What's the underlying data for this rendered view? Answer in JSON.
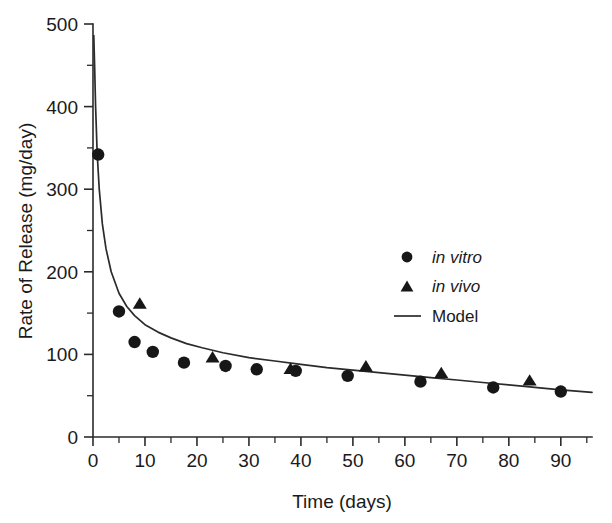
{
  "chart_data": {
    "type": "scatter",
    "title": "",
    "xlabel": "Time (days)",
    "ylabel": "Rate of Release (mg/day)",
    "xlim": [
      0,
      96
    ],
    "ylim": [
      0,
      500
    ],
    "grid": false,
    "legend_position": "center-right",
    "x_ticks": [
      0,
      10,
      20,
      30,
      40,
      50,
      60,
      70,
      80,
      90
    ],
    "x_tick_labels": [
      "0",
      "10",
      "20",
      "30",
      "40",
      "50",
      "60",
      "70",
      "80",
      "90"
    ],
    "x_minor_ticks": [
      5,
      15,
      25,
      35,
      45,
      55,
      65,
      75,
      85,
      95
    ],
    "y_ticks": [
      0,
      100,
      200,
      300,
      400,
      500
    ],
    "y_tick_labels": [
      "0",
      "100",
      "200",
      "300",
      "400",
      "500"
    ],
    "y_minor_ticks": [
      50,
      150,
      250,
      350,
      450
    ],
    "series": [
      {
        "name": "in vitro",
        "marker": "circle",
        "style": "italic",
        "points": [
          [
            1,
            342
          ],
          [
            5,
            152
          ],
          [
            8,
            115
          ],
          [
            11.5,
            103
          ],
          [
            17.5,
            90
          ],
          [
            25.5,
            86
          ],
          [
            31.5,
            82
          ],
          [
            39,
            80
          ],
          [
            49,
            74
          ],
          [
            63,
            67
          ],
          [
            77,
            60
          ],
          [
            90,
            55
          ]
        ]
      },
      {
        "name": "in vivo",
        "marker": "triangle",
        "style": "italic",
        "points": [
          [
            9,
            161
          ],
          [
            23,
            96
          ],
          [
            38,
            82
          ],
          [
            52.5,
            85
          ],
          [
            67,
            77
          ],
          [
            84,
            68
          ]
        ]
      },
      {
        "name": "Model",
        "marker": "line",
        "style": "normal",
        "curve": [
          [
            0.15,
            486
          ],
          [
            0.3,
            452
          ],
          [
            0.5,
            400
          ],
          [
            0.8,
            344
          ],
          [
            1.2,
            300
          ],
          [
            1.8,
            258
          ],
          [
            2.5,
            228
          ],
          [
            3.5,
            200
          ],
          [
            5,
            174
          ],
          [
            6.5,
            158
          ],
          [
            8,
            147
          ],
          [
            10,
            136
          ],
          [
            12.5,
            127
          ],
          [
            15,
            120
          ],
          [
            18,
            113
          ],
          [
            21,
            108
          ],
          [
            25,
            102
          ],
          [
            30,
            96
          ],
          [
            35,
            92
          ],
          [
            40,
            88
          ],
          [
            45,
            84
          ],
          [
            50,
            81
          ],
          [
            55,
            78
          ],
          [
            60,
            75
          ],
          [
            65,
            72
          ],
          [
            70,
            69
          ],
          [
            75,
            66
          ],
          [
            80,
            63
          ],
          [
            85,
            60
          ],
          [
            90,
            57
          ],
          [
            96,
            54
          ]
        ]
      }
    ],
    "legend": [
      {
        "label": "in vitro",
        "marker": "circle",
        "italic": true
      },
      {
        "label": "in vivo",
        "marker": "triangle",
        "italic": true
      },
      {
        "label": "Model",
        "marker": "line",
        "italic": false
      }
    ],
    "colors": {
      "marker": "#171717",
      "axis": "#2b2b2b",
      "curve": "#2b2b2b",
      "background": "#ffffff"
    }
  }
}
